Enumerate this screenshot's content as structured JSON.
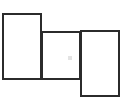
{
  "canvas": {
    "width": 124,
    "height": 111,
    "background_color": "#ffffff"
  },
  "style": {
    "border_color": "#2b2b2b",
    "border_width_px": 2,
    "fill_color": "#ffffff",
    "mark_color": "#e3e3e3"
  },
  "shapes": [
    {
      "name": "left-rectangle",
      "label": "",
      "x": 2,
      "y": 13,
      "width": 40,
      "height": 67
    },
    {
      "name": "middle-rectangle",
      "label": "",
      "x": 41,
      "y": 31,
      "width": 40,
      "height": 49
    },
    {
      "name": "right-rectangle",
      "label": "",
      "x": 80,
      "y": 30,
      "width": 40,
      "height": 67
    }
  ],
  "marks": [
    {
      "name": "faint-gray-mark",
      "label": "",
      "x": 68,
      "y": 56,
      "width": 4,
      "height": 4
    }
  ]
}
